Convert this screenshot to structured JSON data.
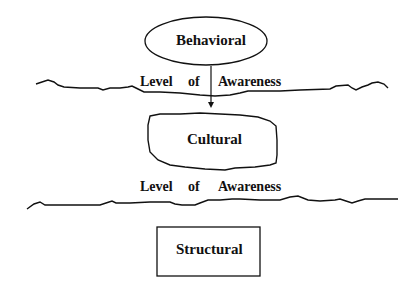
{
  "diagram": {
    "nodes": [
      {
        "id": "behavioral",
        "label": "Behavioral",
        "shape": "ellipse"
      },
      {
        "id": "cultural",
        "label": "Cultural",
        "shape": "irregular-rounded-box"
      },
      {
        "id": "structural",
        "label": "Structural",
        "shape": "rectangle"
      }
    ],
    "dividers": [
      {
        "label_words": [
          "Level",
          "of",
          "Awareness"
        ]
      },
      {
        "label_words": [
          "Level",
          "of",
          "Awareness"
        ]
      }
    ],
    "edges": [
      {
        "from": "behavioral",
        "to": "cultural",
        "style": "arrow"
      }
    ],
    "colors": {
      "stroke": "#111111",
      "background": "#ffffff"
    }
  }
}
